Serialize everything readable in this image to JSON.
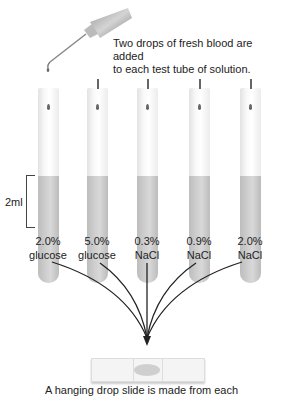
{
  "figure": {
    "top_caption": [
      "Two drops of fresh blood are added",
      "to each test tube of solution."
    ],
    "volume_label": "2ml",
    "tubes": [
      {
        "concentration": "2.0%",
        "solute": "glucose"
      },
      {
        "concentration": "5.0%",
        "solute": "glucose"
      },
      {
        "concentration": "0.3%",
        "solute": "NaCl"
      },
      {
        "concentration": "0.9%",
        "solute": "NaCl"
      },
      {
        "concentration": "2.0%",
        "solute": "NaCl"
      }
    ],
    "bottom_caption": "A hanging drop slide is made from each",
    "colors": {
      "liquid": "#c8c8c8",
      "drop": "#666666",
      "arrow": "#222222"
    }
  }
}
